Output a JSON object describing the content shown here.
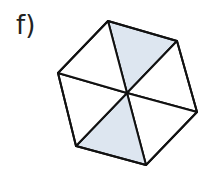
{
  "problem": {
    "label": "f)"
  },
  "figure": {
    "shape": "hexagon divided into 6 triangles",
    "total_parts": 6,
    "shaded_parts": 2,
    "vertices": [
      [
        108,
        21
      ],
      [
        177,
        41
      ],
      [
        197,
        112
      ],
      [
        146,
        165
      ],
      [
        76,
        146
      ],
      [
        58,
        73
      ]
    ],
    "center": [
      127,
      93
    ],
    "shaded_triangles": [
      [
        0,
        1
      ],
      [
        3,
        4
      ]
    ],
    "colors": {
      "stroke": "#111111",
      "shaded_fill": "#dde6f0",
      "unshaded_fill": "#ffffff"
    }
  }
}
